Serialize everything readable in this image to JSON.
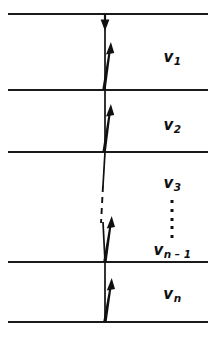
{
  "figure": {
    "type": "diagram",
    "width": 216,
    "height": 340,
    "background_color": "#ffffff",
    "ink_color": "#101010",
    "interface_lines": [
      {
        "name": "interface-0",
        "y": 14,
        "x_start": 8,
        "x_end": 208,
        "style": "solid"
      },
      {
        "name": "interface-1",
        "y": 90,
        "x_start": 8,
        "x_end": 208,
        "style": "solid"
      },
      {
        "name": "interface-2",
        "y": 152,
        "x_start": 8,
        "x_end": 208,
        "style": "solid"
      },
      {
        "name": "interface-3",
        "y": 262,
        "x_start": 8,
        "x_end": 208,
        "style": "solid"
      },
      {
        "name": "interface-4",
        "y": 322,
        "x_start": 8,
        "x_end": 208,
        "style": "solid"
      }
    ],
    "ray_axis_x": 105,
    "downward_arrow": {
      "name": "incident-ray-down",
      "x": 105,
      "y_start": 14,
      "y_end": 30,
      "direction": "down"
    },
    "upward_arrows": [
      {
        "name": "ray-layer-1",
        "x_tail": 103,
        "y_tail": 90,
        "x_head": 110,
        "y_head": 42
      },
      {
        "name": "ray-layer-2",
        "x_tail": 103,
        "y_tail": 152,
        "x_head": 110,
        "y_head": 104
      },
      {
        "name": "ray-layer-n-1",
        "x_tail": 104,
        "y_tail": 262,
        "x_head": 111,
        "y_head": 216
      },
      {
        "name": "ray-layer-n",
        "x_tail": 104,
        "y_tail": 322,
        "x_head": 111,
        "y_head": 278
      }
    ],
    "plain_segments": [
      {
        "name": "ray-segment-layer-3-solid",
        "x1": 105,
        "y1": 152,
        "x2": 103,
        "y2": 186,
        "style": "solid"
      },
      {
        "name": "ray-segment-continuation-dashed",
        "x1": 103,
        "y1": 186,
        "x2": 101,
        "y2": 222,
        "style": "dashed"
      }
    ],
    "labels": [
      {
        "name": "label-v1",
        "base": "v",
        "sub": "1",
        "x": 172,
        "y": 57
      },
      {
        "name": "label-v2",
        "base": "v",
        "sub": "2",
        "x": 172,
        "y": 125
      },
      {
        "name": "label-v3",
        "base": "v",
        "sub": "3",
        "x": 172,
        "y": 183
      },
      {
        "name": "label-vn-1",
        "base": "v",
        "sub": "n – 1",
        "x": 172,
        "y": 250
      },
      {
        "name": "label-vn",
        "base": "v",
        "sub": "n",
        "x": 172,
        "y": 294
      }
    ],
    "vertical_ellipsis": {
      "name": "vertical-ellipsis",
      "x": 172,
      "y_start": 200,
      "y_end": 238,
      "dot_count": 5,
      "glyph": "⋮"
    }
  }
}
